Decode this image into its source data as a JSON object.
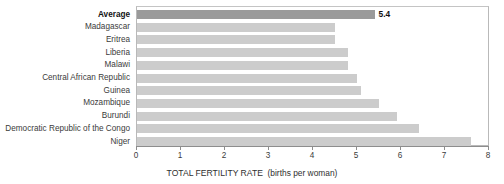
{
  "chart_data": {
    "type": "bar",
    "orientation": "horizontal",
    "title": "",
    "xlabel": "TOTAL FERTILITY RATE  (births per woman)",
    "xlabel_main": "TOTAL FERTILITY RATE",
    "xlabel_unit": "(births per woman)",
    "ylabel": "",
    "xlim": [
      0,
      8
    ],
    "xticks": [
      0,
      1,
      2,
      3,
      4,
      5,
      6,
      7,
      8
    ],
    "xtick_labels": [
      "0",
      "1",
      "2",
      "3",
      "4",
      "5",
      "6",
      "7",
      "8"
    ],
    "grid": false,
    "legend": false,
    "categories": [
      "Average",
      "Madagascar",
      "Eritrea",
      "Liberia",
      "Malawi",
      "Central African Republic",
      "Guinea",
      "Mozambique",
      "Burundi",
      "Democratic Republic of the Congo",
      "Niger"
    ],
    "values": [
      5.4,
      4.5,
      4.5,
      4.8,
      4.8,
      5.0,
      5.1,
      5.5,
      5.9,
      6.4,
      7.6
    ],
    "data_labels": [
      "5.4",
      "",
      "",
      "",
      "",
      "",
      "",
      "",
      "",
      "",
      ""
    ],
    "emphasized_category": "Average",
    "colors": {
      "bar": "#cccccc",
      "bar_emphasized": "#9a9a9a",
      "axis": "#8d8d8d",
      "plot_border": "#b9b9b9",
      "text": "#3b3b3b",
      "text_emphasized": "#111111",
      "background": "#ffffff"
    }
  }
}
